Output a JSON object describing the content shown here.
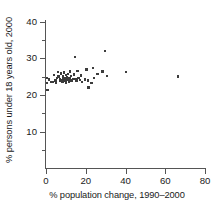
{
  "chart_data": {
    "type": "scatter",
    "title": "",
    "xlabel": "% population change, 1990–2000",
    "ylabel": "% persons under 18 years old, 2000",
    "xlim": [
      0,
      80
    ],
    "ylim": [
      0,
      42
    ],
    "xticks": [
      0,
      20,
      40,
      60,
      80
    ],
    "xticklabels": [
      "0",
      "20",
      "40",
      "60",
      "80"
    ],
    "yticks": [
      10,
      20,
      30,
      40
    ],
    "yticklabels": [
      "10",
      "20",
      "30",
      "40"
    ],
    "yminorticks": [
      5,
      15,
      25,
      35
    ],
    "grid": false,
    "legend": false,
    "marker": "square",
    "marker_color": "#3c3c3c",
    "axis_color": "#555555",
    "points": [
      {
        "x": 0.5,
        "y": 24.7
      },
      {
        "x": 0.6,
        "y": 23.3
      },
      {
        "x": 0.8,
        "y": 21.4
      },
      {
        "x": 1.4,
        "y": 24.2
      },
      {
        "x": 2.6,
        "y": 23.6
      },
      {
        "x": 3.6,
        "y": 23.5
      },
      {
        "x": 4.0,
        "y": 25.5
      },
      {
        "x": 4.7,
        "y": 24.0
      },
      {
        "x": 5.0,
        "y": 23.2
      },
      {
        "x": 5.5,
        "y": 24.6
      },
      {
        "x": 5.9,
        "y": 26.2
      },
      {
        "x": 6.2,
        "y": 25.0
      },
      {
        "x": 6.9,
        "y": 23.8
      },
      {
        "x": 7.1,
        "y": 24.4
      },
      {
        "x": 7.4,
        "y": 25.9
      },
      {
        "x": 7.9,
        "y": 24.1
      },
      {
        "x": 8.2,
        "y": 23.6
      },
      {
        "x": 8.5,
        "y": 25.2
      },
      {
        "x": 8.6,
        "y": 24.8
      },
      {
        "x": 9.0,
        "y": 26.1
      },
      {
        "x": 9.3,
        "y": 23.9
      },
      {
        "x": 9.6,
        "y": 24.5
      },
      {
        "x": 9.9,
        "y": 25.4
      },
      {
        "x": 10.1,
        "y": 23.4
      },
      {
        "x": 10.4,
        "y": 24.9
      },
      {
        "x": 10.8,
        "y": 24.2
      },
      {
        "x": 11.0,
        "y": 25.7
      },
      {
        "x": 11.4,
        "y": 23.7
      },
      {
        "x": 11.7,
        "y": 24.6
      },
      {
        "x": 12.0,
        "y": 26.4
      },
      {
        "x": 12.3,
        "y": 24.0
      },
      {
        "x": 12.7,
        "y": 25.1
      },
      {
        "x": 13.1,
        "y": 23.8
      },
      {
        "x": 13.5,
        "y": 24.4
      },
      {
        "x": 14.1,
        "y": 25.6
      },
      {
        "x": 14.5,
        "y": 30.3
      },
      {
        "x": 14.8,
        "y": 24.3
      },
      {
        "x": 15.3,
        "y": 23.9
      },
      {
        "x": 15.9,
        "y": 26.6
      },
      {
        "x": 16.3,
        "y": 24.7
      },
      {
        "x": 17.0,
        "y": 24.1
      },
      {
        "x": 17.6,
        "y": 25.3
      },
      {
        "x": 18.2,
        "y": 23.6
      },
      {
        "x": 19.5,
        "y": 24.2
      },
      {
        "x": 20.4,
        "y": 26.9
      },
      {
        "x": 21.1,
        "y": 24.0
      },
      {
        "x": 21.4,
        "y": 22.0
      },
      {
        "x": 22.8,
        "y": 23.3
      },
      {
        "x": 23.5,
        "y": 27.3
      },
      {
        "x": 24.0,
        "y": 24.6
      },
      {
        "x": 25.9,
        "y": 25.8
      },
      {
        "x": 28.5,
        "y": 26.4
      },
      {
        "x": 29.8,
        "y": 32.0
      },
      {
        "x": 30.6,
        "y": 25.1
      },
      {
        "x": 40.3,
        "y": 26.2
      },
      {
        "x": 66.3,
        "y": 25.0
      }
    ]
  }
}
